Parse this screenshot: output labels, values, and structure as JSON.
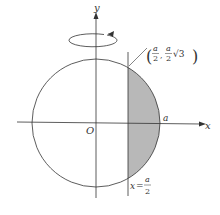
{
  "diagram": {
    "type": "solid-of-revolution",
    "axes": {
      "x_label": "x",
      "y_label": "y",
      "origin_label": "O"
    },
    "labels": {
      "radius_point": "a",
      "intersection_point": {
        "open": "(",
        "x_num": "a",
        "x_den": "2",
        "comma": ",",
        "y_num": "a",
        "y_den": "2",
        "y_root": "√3",
        "close": ")"
      },
      "vertical_line": {
        "lhs": "x",
        "eq": "=",
        "num": "a",
        "den": "2"
      }
    },
    "colors": {
      "stroke": "#333333",
      "shade": "#b8b8b8"
    },
    "rotation_indicator": "counterclockwise-arrow-around-y-axis"
  }
}
